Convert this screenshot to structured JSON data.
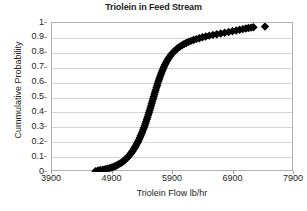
{
  "chart_data": {
    "type": "scatter",
    "title": "Triolein in Feed Stream",
    "xlabel": "Triolein Flow lb/hr",
    "ylabel": "Cummulative Probability",
    "xlim": [
      3900,
      7900
    ],
    "ylim": [
      0,
      1
    ],
    "xticks": [
      3900,
      4900,
      5900,
      6900,
      7900
    ],
    "yticks": [
      0,
      0.1,
      0.2,
      0.3,
      0.4,
      0.5,
      0.6,
      0.7,
      0.8,
      0.9,
      1
    ],
    "xtick_labels": [
      "3900",
      "4900",
      "5900",
      "6900",
      "7900"
    ],
    "ytick_labels": [
      "0",
      "0.1",
      "0.2",
      "0.3",
      "0.4",
      "0.5",
      "0.6",
      "0.7",
      "0.8",
      "0.9",
      "1"
    ],
    "grid": "horizontal",
    "legend": "none",
    "marker": "diamond",
    "marker_color": "#000000",
    "marker_size": 4.2,
    "series": [
      {
        "name": "Triolein cumulative distribution",
        "points": [
          [
            4620,
            0.006
          ],
          [
            4660,
            0.01
          ],
          [
            4700,
            0.013
          ],
          [
            4740,
            0.016
          ],
          [
            4780,
            0.019
          ],
          [
            4815,
            0.022
          ],
          [
            4850,
            0.026
          ],
          [
            4880,
            0.03
          ],
          [
            4910,
            0.034
          ],
          [
            4940,
            0.039
          ],
          [
            4968,
            0.044
          ],
          [
            4995,
            0.05
          ],
          [
            5020,
            0.056
          ],
          [
            5045,
            0.062
          ],
          [
            5068,
            0.069
          ],
          [
            5090,
            0.076
          ],
          [
            5112,
            0.084
          ],
          [
            5133,
            0.092
          ],
          [
            5153,
            0.1
          ],
          [
            5172,
            0.109
          ],
          [
            5191,
            0.118
          ],
          [
            5209,
            0.128
          ],
          [
            5227,
            0.138
          ],
          [
            5244,
            0.148
          ],
          [
            5261,
            0.159
          ],
          [
            5277,
            0.17
          ],
          [
            5293,
            0.181
          ],
          [
            5308,
            0.193
          ],
          [
            5323,
            0.205
          ],
          [
            5338,
            0.217
          ],
          [
            5352,
            0.23
          ],
          [
            5366,
            0.243
          ],
          [
            5380,
            0.256
          ],
          [
            5393,
            0.269
          ],
          [
            5406,
            0.283
          ],
          [
            5419,
            0.297
          ],
          [
            5432,
            0.311
          ],
          [
            5444,
            0.325
          ],
          [
            5456,
            0.339
          ],
          [
            5468,
            0.354
          ],
          [
            5480,
            0.369
          ],
          [
            5492,
            0.384
          ],
          [
            5503,
            0.399
          ],
          [
            5515,
            0.414
          ],
          [
            5526,
            0.429
          ],
          [
            5537,
            0.444
          ],
          [
            5548,
            0.459
          ],
          [
            5559,
            0.474
          ],
          [
            5570,
            0.49
          ],
          [
            5581,
            0.505
          ],
          [
            5592,
            0.52
          ],
          [
            5603,
            0.535
          ],
          [
            5614,
            0.55
          ],
          [
            5625,
            0.565
          ],
          [
            5637,
            0.58
          ],
          [
            5648,
            0.595
          ],
          [
            5660,
            0.61
          ],
          [
            5672,
            0.624
          ],
          [
            5684,
            0.638
          ],
          [
            5697,
            0.652
          ],
          [
            5710,
            0.666
          ],
          [
            5723,
            0.68
          ],
          [
            5737,
            0.693
          ],
          [
            5751,
            0.706
          ],
          [
            5766,
            0.719
          ],
          [
            5781,
            0.731
          ],
          [
            5797,
            0.743
          ],
          [
            5814,
            0.755
          ],
          [
            5832,
            0.766
          ],
          [
            5851,
            0.777
          ],
          [
            5871,
            0.788
          ],
          [
            5892,
            0.798
          ],
          [
            5914,
            0.808
          ],
          [
            5938,
            0.817
          ],
          [
            5963,
            0.826
          ],
          [
            5990,
            0.835
          ],
          [
            6019,
            0.843
          ],
          [
            6050,
            0.851
          ],
          [
            6083,
            0.859
          ],
          [
            6118,
            0.866
          ],
          [
            6156,
            0.873
          ],
          [
            6196,
            0.88
          ],
          [
            6239,
            0.886
          ],
          [
            6285,
            0.892
          ],
          [
            6334,
            0.898
          ],
          [
            6386,
            0.904
          ],
          [
            6441,
            0.909
          ],
          [
            6499,
            0.915
          ],
          [
            6560,
            0.92
          ],
          [
            6623,
            0.925
          ],
          [
            6688,
            0.93
          ],
          [
            6754,
            0.935
          ],
          [
            6820,
            0.94
          ],
          [
            6884,
            0.945
          ],
          [
            6945,
            0.95
          ],
          [
            7002,
            0.955
          ],
          [
            7055,
            0.959
          ],
          [
            7104,
            0.963
          ],
          [
            7148,
            0.966
          ],
          [
            7190,
            0.969
          ],
          [
            7230,
            0.971
          ],
          [
            7420,
            0.976
          ],
          [
            7980,
            0.99
          ]
        ]
      }
    ]
  }
}
